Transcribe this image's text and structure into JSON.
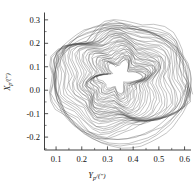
{
  "chart_data": {
    "type": "line",
    "title": "",
    "subtitle": "",
    "xlabel": "Y_p/(″)",
    "ylabel": "X_p/(″)",
    "xlabel_base": "Y",
    "xlabel_sub": "p",
    "xlabel_unit": "/(″)",
    "ylabel_base": "X",
    "ylabel_sub": "p",
    "ylabel_unit": "/(″)",
    "xlim": [
      0.055,
      0.625
    ],
    "ylim": [
      -0.255,
      0.325
    ],
    "xticks": [
      0.1,
      0.2,
      0.3,
      0.4,
      0.5,
      0.6
    ],
    "yticks": [
      0.3,
      0.2,
      0.1,
      0.0,
      -0.1,
      -0.2
    ],
    "xticklabels": [
      "0.1",
      "0.2",
      "0.3",
      "0.4",
      "0.5",
      "0.6"
    ],
    "yticklabels": [
      "0.3",
      "0.2",
      "0.1",
      "0.0",
      "-0.1",
      "-0.2"
    ],
    "minor_ticks_per_interval": 1,
    "grid": false,
    "legend": false,
    "legend_position": "none",
    "spines": [
      "left",
      "bottom"
    ],
    "tick_direction": "in",
    "line_color": "#4d4d4d",
    "background_color": "#ffffff",
    "series": [
      {
        "name": "shaft-orbit",
        "n_revolutions": 34,
        "center": [
          0.345,
          0.04
        ],
        "radius_outer_x": 0.262,
        "radius_outer_y": 0.262,
        "radius_inner_x": 0.058,
        "radius_inner_y": 0.058,
        "x_range": [
          0.083,
          0.605
        ],
        "y_range": [
          -0.228,
          0.302
        ],
        "inner_core_center": [
          0.36,
          0.125
        ],
        "noise_amplitude": 0.012,
        "precession_rate": 0.085
      }
    ]
  },
  "axes": {
    "x_axis_name": "Yp-displacement-axis",
    "y_axis_name": "Xp-displacement-axis"
  }
}
